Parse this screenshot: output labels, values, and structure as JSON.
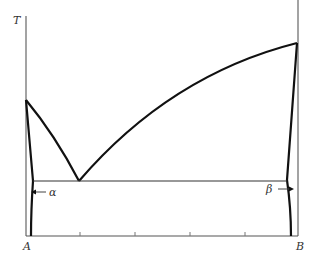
{
  "diagram": {
    "type": "binary eutectic phase diagram",
    "axis_label_y": "T",
    "component_left": "A",
    "component_right": "B",
    "phase_left": "α",
    "phase_right": "β",
    "colors": {
      "axis": "#666666",
      "curve": "#111111",
      "label": "#333333"
    },
    "x_ticks_count": 4
  }
}
